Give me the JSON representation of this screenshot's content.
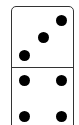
{
  "domino": {
    "top_value": 3,
    "bottom_value": 4,
    "colors": {
      "border": "#333333",
      "pip": "#000000",
      "face": "#ffffff"
    },
    "top_pips": [
      {
        "x": 61,
        "y": 20
      },
      {
        "x": 43,
        "y": 37
      },
      {
        "x": 24,
        "y": 55
      }
    ],
    "bottom_pips": [
      {
        "x": 24,
        "y": 80
      },
      {
        "x": 61,
        "y": 80
      },
      {
        "x": 24,
        "y": 116
      },
      {
        "x": 61,
        "y": 116
      }
    ]
  }
}
